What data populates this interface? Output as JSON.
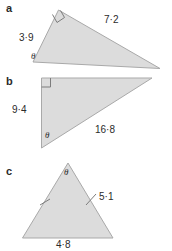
{
  "page": {
    "background_color": "#ffffff",
    "ink_color": "#2b2b2b",
    "shape_fill": "#dcdcdc",
    "shape_outline": "#a9a9a9"
  },
  "parts": {
    "a": {
      "letter": "a",
      "shape": "right-triangle",
      "labels": {
        "short_side": "3·9",
        "hypotenuse": "7·2",
        "angle": "θ"
      },
      "markers": {
        "right_angle": "right-angle-square"
      }
    },
    "b": {
      "letter": "b",
      "shape": "right-triangle",
      "labels": {
        "vertical_side": "9·4",
        "hypotenuse": "16·8",
        "angle": "θ"
      },
      "markers": {
        "right_angle": "right-angle-square"
      }
    },
    "c": {
      "letter": "c",
      "shape": "isosceles-triangle",
      "labels": {
        "equal_side": "5·1",
        "base": "4·8",
        "angle": "θ"
      },
      "markers": {
        "left_side_tick": "single-tick",
        "right_side_tick": "single-tick"
      }
    }
  }
}
